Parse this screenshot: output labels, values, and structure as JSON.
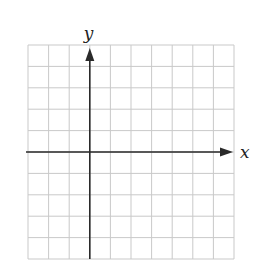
{
  "diagram": {
    "type": "coordinate-grid",
    "grid": {
      "columns": 10,
      "rows": 10,
      "left": 28,
      "top": 45,
      "right": 234,
      "bottom": 259,
      "line_color": "#c9c9c9"
    },
    "axes": {
      "color": "#2a2a2a",
      "origin_col": 3,
      "origin_row": 5,
      "x_label": "x",
      "y_label": "y",
      "x_arrow": "right",
      "y_arrow": "up"
    }
  }
}
